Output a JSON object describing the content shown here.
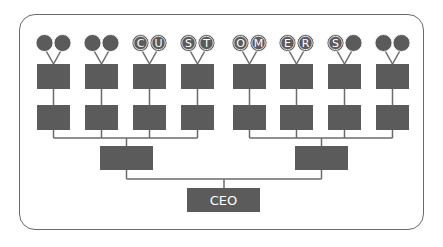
{
  "diagram": {
    "customers_word": "CUSTOMERS",
    "circle_letters": [
      "",
      "",
      "",
      "",
      "C",
      "U",
      "S",
      "T",
      "O",
      "M",
      "E",
      "R",
      "S",
      "",
      "",
      ""
    ],
    "ceo_label": "CEO",
    "colors": {
      "box": "#5b5b5b",
      "line": "#6b6b6b",
      "frame": "#6a6a6a",
      "text": "#ffffff"
    },
    "levels": [
      {
        "name": "customers",
        "count": 16
      },
      {
        "name": "front-line",
        "count": 8
      },
      {
        "name": "staff",
        "count": 8
      },
      {
        "name": "managers",
        "count": 2
      },
      {
        "name": "ceo",
        "count": 1
      }
    ]
  }
}
